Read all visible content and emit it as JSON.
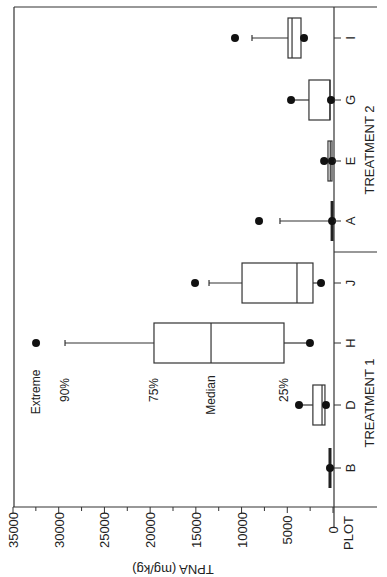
{
  "chart_data": {
    "type": "box",
    "orientation": "rotated-90",
    "title": "",
    "ylabel": "TPNA (mg/kg)",
    "xlabel": "PLOT",
    "ylim": [
      0,
      35000
    ],
    "yticks": [
      35000,
      30000,
      25000,
      20000,
      15000,
      10000,
      5000,
      0
    ],
    "grid": false,
    "groups": [
      {
        "name": "TREATMENT 1",
        "plots": [
          "B",
          "D",
          "H",
          "J"
        ]
      },
      {
        "name": "TREATMENT 2",
        "plots": [
          "A",
          "E",
          "G",
          "I"
        ]
      }
    ],
    "legend_labels": {
      "extreme": "Extreme",
      "p90": "90%",
      "p75": "75%",
      "median": "Median",
      "p25": "25%"
    },
    "series": [
      {
        "name": "B",
        "group": "TREATMENT 1",
        "p10": 330,
        "p25": 330,
        "median": 330,
        "p75": 330,
        "p90": 330,
        "extreme": null,
        "low_point": 330
      },
      {
        "name": "D",
        "group": "TREATMENT 1",
        "p10": 770,
        "p25": 880,
        "median": 1200,
        "p75": 2200,
        "p90": 3720,
        "extreme": 3720,
        "low_point": 770
      },
      {
        "name": "H",
        "group": "TREATMENT 1",
        "p10": 2520,
        "p25": 5360,
        "median": 13340,
        "p75": 19580,
        "p90": 29310,
        "extreme": 32480,
        "low_point": 2520
      },
      {
        "name": "J",
        "group": "TREATMENT 1",
        "p10": 1310,
        "p25": 2190,
        "median": 3940,
        "p75": 9950,
        "p90": 13560,
        "extreme": 15090,
        "low_point": 1310
      },
      {
        "name": "A",
        "group": "TREATMENT 2",
        "p10": 100,
        "p25": 100,
        "median": 100,
        "p75": 150,
        "p90": 5800,
        "extreme": 8090,
        "low_point": 100
      },
      {
        "name": "E",
        "group": "TREATMENT 2",
        "p10": 110,
        "p25": 110,
        "median": 300,
        "p75": 550,
        "p90": 970,
        "extreme": 970,
        "low_point": 110
      },
      {
        "name": "G",
        "group": "TREATMENT 2",
        "p10": 220,
        "p25": 330,
        "median": 330,
        "p75": 2630,
        "p90": 4590,
        "extreme": 4590,
        "low_point": 220
      },
      {
        "name": "I",
        "group": "TREATMENT 2",
        "p10": 3170,
        "p25": 3500,
        "median": 4480,
        "p75": 4920,
        "p90": 8860,
        "extreme": 10720,
        "low_point": 3170
      }
    ]
  },
  "layout": {
    "axis": {
      "x0_px": 333,
      "x35000_px": 13,
      "axis_y_px": 507
    },
    "plot_order_top_to_bottom": [
      "I",
      "G",
      "E",
      "A",
      "J",
      "H",
      "D",
      "B"
    ],
    "plot_y_px": {
      "I": 38,
      "G": 100,
      "E": 161,
      "A": 221,
      "J": 283,
      "H": 343,
      "D": 405,
      "B": 468
    }
  }
}
